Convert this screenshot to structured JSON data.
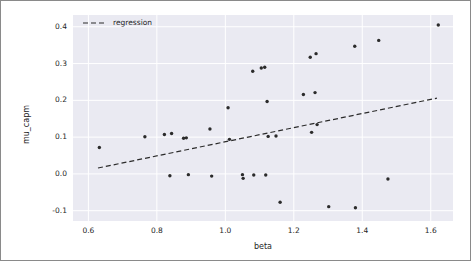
{
  "figure": {
    "background_color": "#ffffff",
    "border_color": "#8a8a8a",
    "plot_background_color": "#eaeaf2",
    "grid_color": "#ffffff",
    "marker_color": "#2b2b2b",
    "line_color": "#2b2b2b"
  },
  "legend": {
    "entries": [
      {
        "label": "regression",
        "style": "dashed-line",
        "color": "#2b2b2b"
      }
    ]
  },
  "chart_data": {
    "type": "scatter",
    "title": "",
    "xlabel": "beta",
    "ylabel": "mu_capm",
    "xlim": [
      0.555,
      1.665
    ],
    "ylim": [
      -0.128,
      0.432
    ],
    "xticks": [
      0.6,
      0.8,
      1.0,
      1.2,
      1.4,
      1.6
    ],
    "xtick_labels": [
      "0.6",
      "0.8",
      "1.0",
      "1.2",
      "1.4",
      "1.6"
    ],
    "yticks": [
      -0.1,
      0.0,
      0.1,
      0.2,
      0.3,
      0.4
    ],
    "ytick_labels": [
      "-0.1",
      "0.0",
      "0.1",
      "0.2",
      "0.3",
      "0.4"
    ],
    "grid": true,
    "legend_position": "upper left",
    "series": [
      {
        "name": "assets",
        "type": "scatter",
        "marker": "circle",
        "color": "#2b2b2b",
        "points": [
          {
            "x": 0.632,
            "y": 0.072
          },
          {
            "x": 0.765,
            "y": 0.101
          },
          {
            "x": 0.822,
            "y": 0.107
          },
          {
            "x": 0.838,
            "y": -0.005
          },
          {
            "x": 0.843,
            "y": 0.11
          },
          {
            "x": 0.878,
            "y": 0.097
          },
          {
            "x": 0.886,
            "y": 0.098
          },
          {
            "x": 0.892,
            "y": -0.002
          },
          {
            "x": 0.955,
            "y": 0.122
          },
          {
            "x": 0.96,
            "y": -0.006
          },
          {
            "x": 1.008,
            "y": 0.18
          },
          {
            "x": 1.012,
            "y": 0.094
          },
          {
            "x": 1.05,
            "y": -0.002
          },
          {
            "x": 1.052,
            "y": -0.012
          },
          {
            "x": 1.08,
            "y": 0.279
          },
          {
            "x": 1.083,
            "y": -0.003
          },
          {
            "x": 1.105,
            "y": 0.288
          },
          {
            "x": 1.115,
            "y": 0.29
          },
          {
            "x": 1.118,
            "y": -0.003
          },
          {
            "x": 1.122,
            "y": 0.197
          },
          {
            "x": 1.125,
            "y": 0.102
          },
          {
            "x": 1.148,
            "y": 0.103
          },
          {
            "x": 1.16,
            "y": -0.077
          },
          {
            "x": 1.228,
            "y": 0.216
          },
          {
            "x": 1.248,
            "y": 0.317
          },
          {
            "x": 1.252,
            "y": 0.113
          },
          {
            "x": 1.262,
            "y": 0.221
          },
          {
            "x": 1.265,
            "y": 0.327
          },
          {
            "x": 1.268,
            "y": 0.134
          },
          {
            "x": 1.302,
            "y": -0.089
          },
          {
            "x": 1.378,
            "y": 0.347
          },
          {
            "x": 1.38,
            "y": -0.092
          },
          {
            "x": 1.448,
            "y": 0.363
          },
          {
            "x": 1.475,
            "y": -0.014
          },
          {
            "x": 1.622,
            "y": 0.405
          }
        ]
      },
      {
        "name": "regression",
        "type": "line",
        "style": "dashed",
        "color": "#2b2b2b",
        "x": [
          0.628,
          1.618
        ],
        "y": [
          0.016,
          0.206
        ]
      }
    ]
  }
}
